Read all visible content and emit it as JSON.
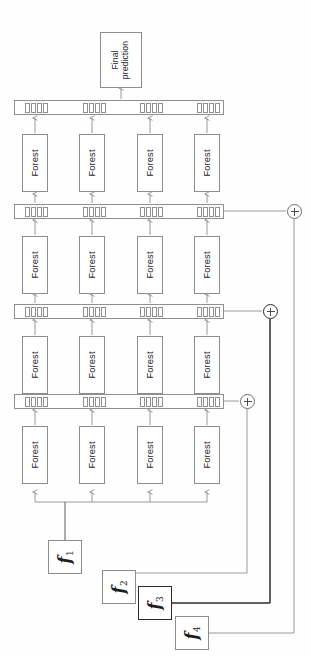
{
  "figure": {
    "orientation": "rotated-90"
  },
  "final_prediction": {
    "label": "Final\nprediction",
    "name": "final-prediction-box"
  },
  "forest_label": "Forest",
  "layers": [
    {
      "id": "layer-4",
      "bar_name": "representation-bar-4",
      "forests": [
        "Forest",
        "Forest",
        "Forest",
        "Forest"
      ],
      "cell_groups": 4,
      "cells_per_group": 4
    },
    {
      "id": "layer-3",
      "bar_name": "representation-bar-3",
      "forests": [
        "Forest",
        "Forest",
        "Forest",
        "Forest"
      ],
      "cell_groups": 4,
      "cells_per_group": 4
    },
    {
      "id": "layer-2",
      "bar_name": "representation-bar-2",
      "forests": [
        "Forest",
        "Forest",
        "Forest",
        "Forest"
      ],
      "cell_groups": 4,
      "cells_per_group": 4
    },
    {
      "id": "layer-1",
      "bar_name": "representation-bar-1",
      "forests": [
        "Forest",
        "Forest",
        "Forest",
        "Forest"
      ],
      "cell_groups": 4,
      "cells_per_group": 4
    }
  ],
  "features": [
    {
      "id": "f1",
      "symbol": "f",
      "subscript": "1",
      "emphasis": "normal"
    },
    {
      "id": "f2",
      "symbol": "f",
      "subscript": "2",
      "emphasis": "normal"
    },
    {
      "id": "f3",
      "symbol": "f",
      "subscript": "3",
      "emphasis": "strong"
    },
    {
      "id": "f4",
      "symbol": "f",
      "subscript": "4",
      "emphasis": "normal"
    }
  ],
  "adders": [
    {
      "id": "adder-1",
      "glyph": "+",
      "emphasis": "normal",
      "feeds": "layer-1-output"
    },
    {
      "id": "adder-2",
      "glyph": "+",
      "emphasis": "strong",
      "feeds": "layer-2-output"
    },
    {
      "id": "adder-3",
      "glyph": "+",
      "emphasis": "normal",
      "feeds": "layer-3-output"
    }
  ],
  "colors": {
    "stroke_light": "#8f8f8f",
    "stroke_dark": "#2b2b2b",
    "background": "#fefefe",
    "text": "#1d1d1d"
  }
}
